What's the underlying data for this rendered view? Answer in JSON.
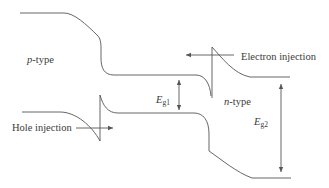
{
  "diagram": {
    "colors": {
      "line": "#555555",
      "text": "#3a3a3a",
      "background": "#ffffff"
    },
    "labels": {
      "p_type": {
        "italic": "p",
        "rest": "-type"
      },
      "n_type": {
        "italic": "n",
        "rest": "-type"
      },
      "electron_injection": "Electron injection",
      "hole_injection": "Hole injection",
      "eg1": {
        "symbol": "E",
        "subscript": "g1"
      },
      "eg2": {
        "symbol": "E",
        "subscript": "g2"
      }
    },
    "elements": [
      "conduction-band-p-side",
      "conduction-band-n-side-spike",
      "valence-band-p-side-notch",
      "valence-band-n-side",
      "electron-injection-arrow",
      "hole-injection-arrow",
      "eg1-double-arrow",
      "eg2-double-arrow"
    ]
  }
}
